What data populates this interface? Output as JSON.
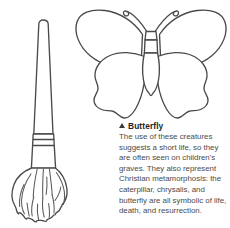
{
  "page": {
    "background_color": "#ffffff",
    "ink_color": "#4a4a4a",
    "text_color": "#4b4b4b"
  },
  "illustrations": [
    {
      "name": "paintbrush",
      "label": "paintbrush line drawing with handle, ferrule bands and bristles"
    },
    {
      "name": "butterfly",
      "label": "butterfly line drawing with two upper wings, two lower wings, segmented body and curled antennae"
    }
  ],
  "caption": {
    "marker": "triangle-up-marker",
    "title": "Butterfly",
    "body": "The use of these creatures suggests a short life, so they are often seen on children's graves. They also represent Christian metamorphosis: the caterpillar, chrysalis, and butterfly are all symbolic of life, death, and resurrection."
  }
}
